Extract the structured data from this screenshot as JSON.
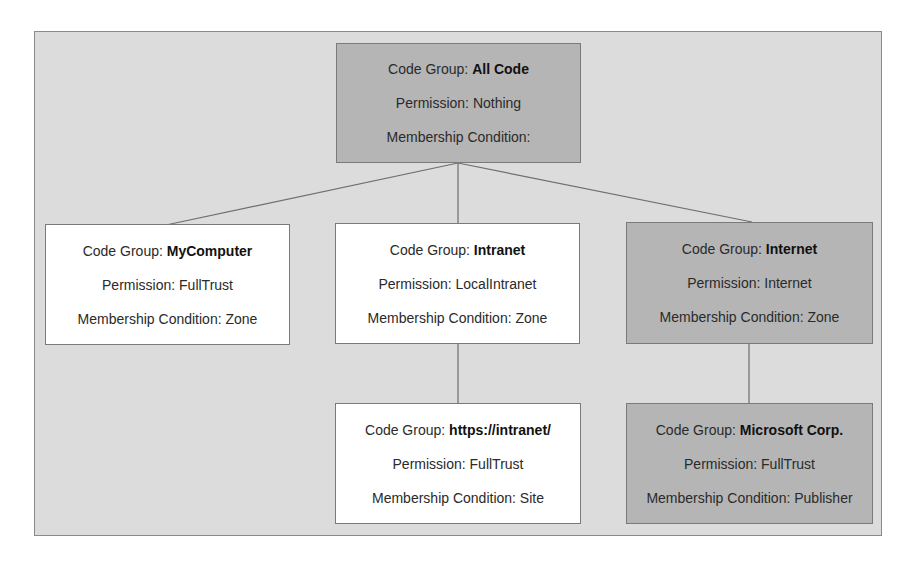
{
  "diagram": {
    "colors": {
      "frame_background": "#dcdcdc",
      "frame_border": "#8a8a8a",
      "shaded_node": "#b5b5b5",
      "white_node": "#ffffff",
      "connector": "#6e6e6e"
    },
    "label_prefixes": {
      "code_group": "Code Group: ",
      "permission": "Permission: ",
      "membership_condition": "Membership Condition: "
    },
    "nodes": [
      {
        "id": "all-code",
        "shaded": true,
        "code_group": "All Code",
        "permission": "Nothing",
        "membership_condition": ""
      },
      {
        "id": "mycomputer",
        "shaded": false,
        "code_group": "MyComputer",
        "permission": "FullTrust",
        "membership_condition": "Zone"
      },
      {
        "id": "intranet",
        "shaded": false,
        "code_group": "Intranet",
        "permission": "LocalIntranet",
        "membership_condition": "Zone"
      },
      {
        "id": "internet",
        "shaded": true,
        "code_group": "Internet",
        "permission": "Internet",
        "membership_condition": "Zone"
      },
      {
        "id": "https-intranet",
        "shaded": false,
        "code_group": "https://intranet/",
        "permission": "FullTrust",
        "membership_condition": "Site"
      },
      {
        "id": "microsoft-corp",
        "shaded": true,
        "code_group": "Microsoft Corp.",
        "permission": "FullTrust",
        "membership_condition": "Publisher"
      }
    ],
    "edges": [
      {
        "from": "all-code",
        "to": "mycomputer"
      },
      {
        "from": "all-code",
        "to": "intranet"
      },
      {
        "from": "all-code",
        "to": "internet"
      },
      {
        "from": "intranet",
        "to": "https-intranet"
      },
      {
        "from": "internet",
        "to": "microsoft-corp"
      }
    ]
  }
}
